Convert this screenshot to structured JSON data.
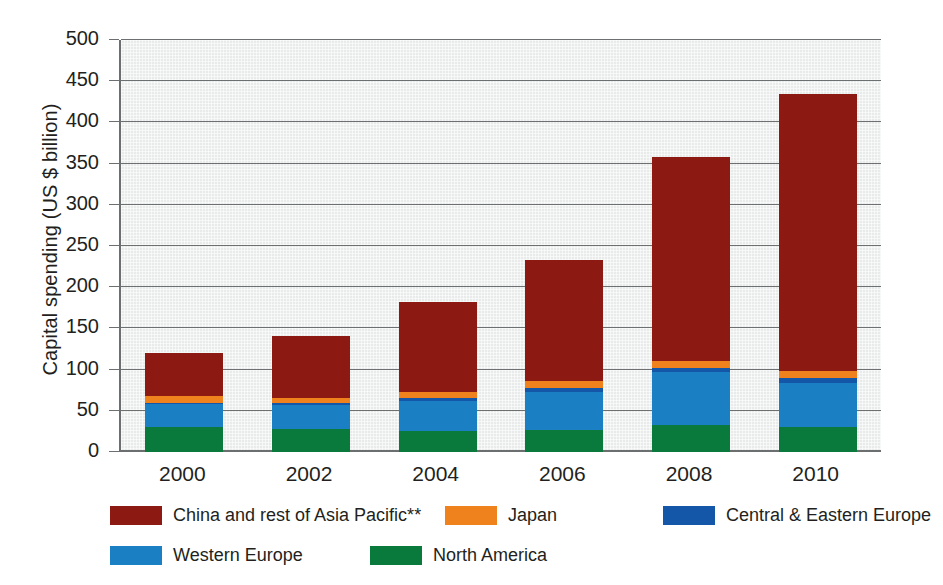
{
  "chart_data": {
    "type": "bar",
    "subtype": "stacked-vertical",
    "title": "",
    "xlabel": "",
    "ylabel": "Capital spending (US $ billion)",
    "categories": [
      "2000",
      "2002",
      "2004",
      "2006",
      "2008",
      "2010"
    ],
    "ylim": [
      0,
      500
    ],
    "yticks": [
      0,
      50,
      100,
      150,
      200,
      250,
      300,
      350,
      400,
      450,
      500
    ],
    "ytick_labels": [
      "0",
      "50",
      "100",
      "150",
      "200",
      "250",
      "300",
      "350",
      "400",
      "450",
      "500"
    ],
    "grid": true,
    "legend_position": "bottom",
    "stack_order_bottom_to_top": [
      "North America",
      "Western Europe",
      "Central & Eastern Europe",
      "Japan",
      "China and rest of Asia Pacific**"
    ],
    "series": [
      {
        "name": "North America",
        "color": "#0a7a3c",
        "values": [
          30,
          28,
          26,
          27,
          33,
          30
        ]
      },
      {
        "name": "Western Europe",
        "color": "#1b7fc4",
        "values": [
          28,
          29,
          36,
          46,
          64,
          54
        ]
      },
      {
        "name": "Central & Eastern Europe",
        "color": "#1456a8",
        "values": [
          2,
          2,
          3,
          5,
          5,
          6
        ]
      },
      {
        "name": "Japan",
        "color": "#f0821e",
        "values": [
          8,
          7,
          8,
          8,
          8,
          8
        ]
      },
      {
        "name": "China and rest of Asia Pacific**",
        "color": "#8c1a12",
        "values": [
          52,
          75,
          109,
          147,
          248,
          337
        ]
      }
    ],
    "totals": [
      120,
      141,
      182,
      233,
      358,
      435
    ],
    "notes": "**"
  },
  "legend": {
    "rows": [
      [
        {
          "label": "China and rest of Asia Pacific**",
          "color": "#8c1a12"
        },
        {
          "label": "Japan",
          "color": "#f0821e"
        },
        {
          "label": "Central & Eastern Europe",
          "color": "#1456a8"
        }
      ],
      [
        {
          "label": "Western Europe",
          "color": "#1b7fc4"
        },
        {
          "label": "North America",
          "color": "#0a7a3c"
        }
      ]
    ]
  }
}
